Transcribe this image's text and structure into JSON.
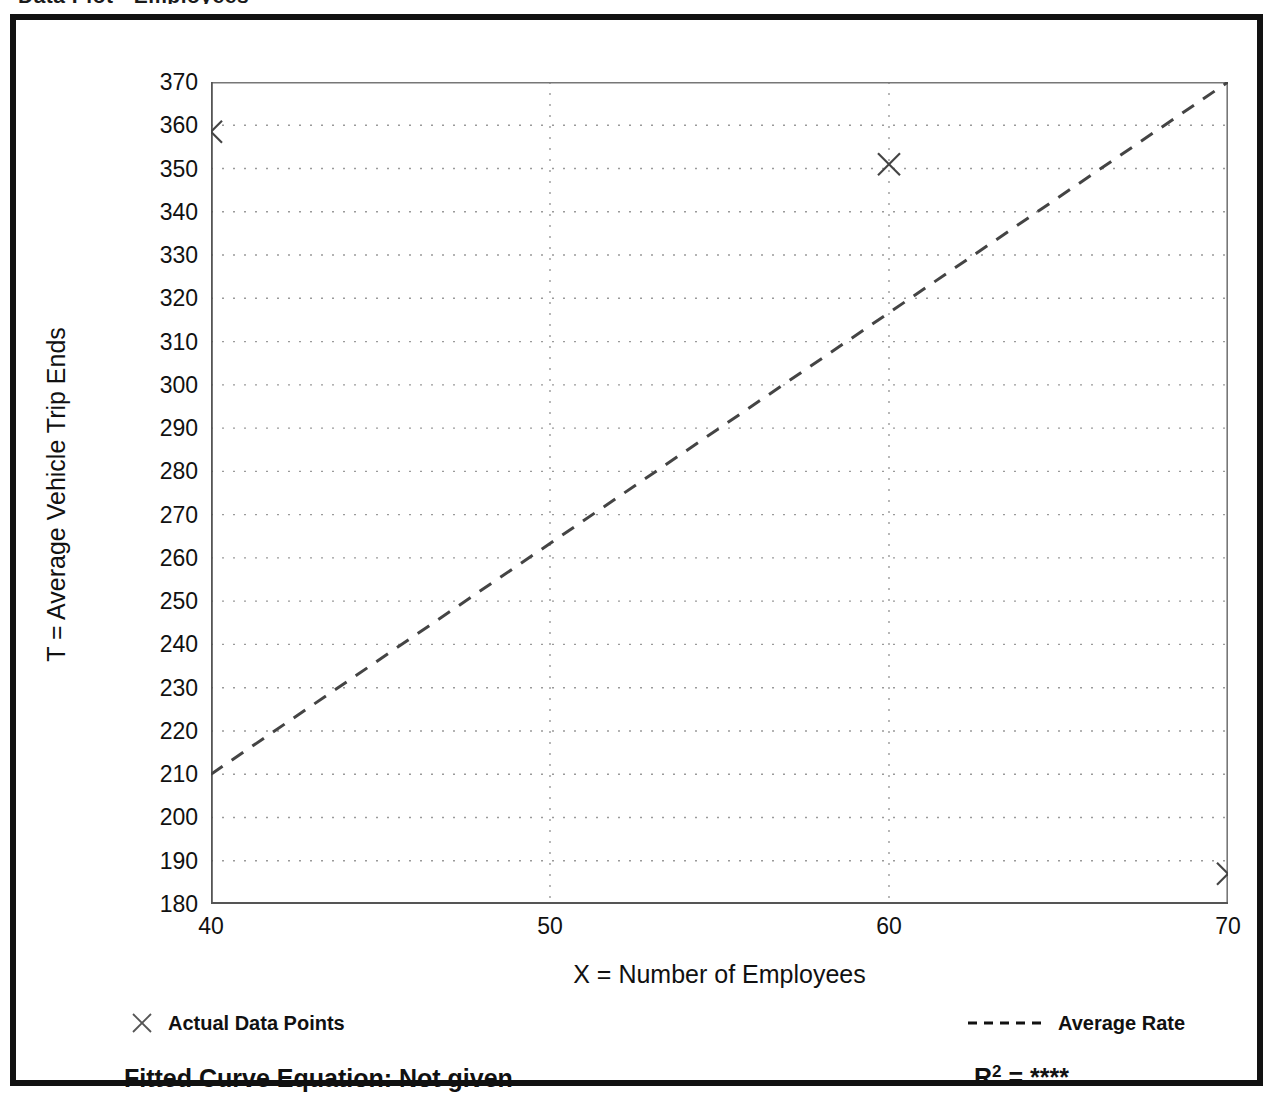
{
  "figure": {
    "title_remnant": "Data Plot - Employees",
    "fitted_curve_equation": "Fitted Curve Equation:  Not given",
    "r2_label": "R",
    "r2_exponent": "2",
    "r2_equals": " = ",
    "r2_value": "****"
  },
  "legend": {
    "data_points_label": "Actual Data Points",
    "average_rate_label": "Average Rate",
    "data_point_marker": "x-cross-marker",
    "average_rate_marker": "dashed-line-swatch"
  },
  "chart_data": {
    "type": "scatter",
    "title": "",
    "xlabel": "X = Number of Employees",
    "ylabel": "T = Average Vehicle Trip Ends",
    "xlim": [
      40,
      70
    ],
    "ylim": [
      180,
      370
    ],
    "xticks": [
      40,
      50,
      60,
      70
    ],
    "xtick_labels": [
      "40",
      "50",
      "60",
      "70"
    ],
    "xminor_ticks": [
      45,
      55,
      65
    ],
    "yticks": [
      180,
      190,
      200,
      210,
      220,
      230,
      240,
      250,
      260,
      270,
      280,
      290,
      300,
      310,
      320,
      330,
      340,
      350,
      360,
      370
    ],
    "ytick_labels": [
      "180",
      "190",
      "200",
      "210",
      "220",
      "230",
      "240",
      "250",
      "260",
      "270",
      "280",
      "290",
      "300",
      "310",
      "320",
      "330",
      "340",
      "350",
      "360",
      "370"
    ],
    "yminor_step": 5,
    "grid": true,
    "grid_style": "dotted",
    "grid_color": "#9a9a9a",
    "legend_position": "below-axes",
    "series": [
      {
        "name": "Actual Data Points",
        "type": "scatter",
        "marker": "x",
        "color": "#444444",
        "points": [
          {
            "x": 40,
            "y": 358.5
          },
          {
            "x": 60,
            "y": 351
          },
          {
            "x": 70,
            "y": 187
          }
        ]
      },
      {
        "name": "Average Rate",
        "type": "line",
        "linestyle": "dashed",
        "color": "#444444",
        "points": [
          {
            "x": 40,
            "y": 210
          },
          {
            "x": 70,
            "y": 370
          }
        ]
      }
    ]
  }
}
